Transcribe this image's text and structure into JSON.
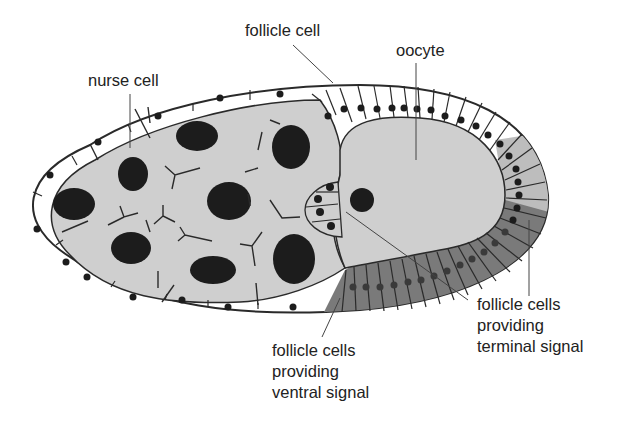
{
  "diagram": {
    "type": "biology-illustration",
    "labels": {
      "follicle_cell": "follicle cell",
      "oocyte": "oocyte",
      "nurse_cell": "nurse cell",
      "ventral": [
        "follicle cells",
        "providing",
        "ventral signal"
      ],
      "terminal": [
        "follicle cells",
        "providing",
        "terminal signal"
      ]
    },
    "colors": {
      "cytoplasm": "#cfcfcf",
      "nucleus": "#1c1c1c",
      "ventral_follicle": "#7a7a7a",
      "terminal_follicle": "#bdbdbd",
      "outline": "#2a2a2a",
      "background": "#ffffff"
    }
  }
}
